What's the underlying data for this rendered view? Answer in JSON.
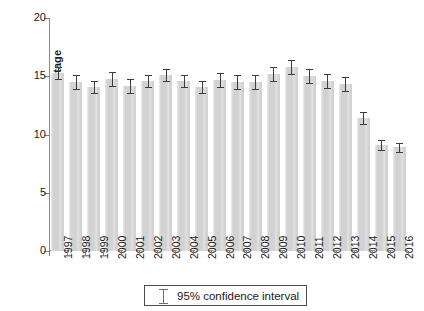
{
  "chart_data": {
    "type": "bar",
    "title": "",
    "subtitle": "",
    "xlabel": "",
    "ylabel": "Percentage",
    "ylim": [
      0,
      20
    ],
    "yticks": [
      0,
      5,
      10,
      15,
      20
    ],
    "ytick_labels": [
      "0",
      "5",
      "10",
      "15",
      "20"
    ],
    "grid": false,
    "legend_position": "bottom-center",
    "legend": [
      {
        "label": "95% confidence interval",
        "marker": "error-bar-glyph"
      }
    ],
    "bar_color": "#d2d2d2",
    "error_bar_color": "#3c3c3c",
    "axis_color": "#8a8a8a",
    "categories": [
      "1997",
      "1998",
      "1999",
      "2000",
      "2001",
      "2002",
      "2003",
      "2004",
      "2005",
      "2006",
      "2007",
      "2008",
      "2009",
      "2010",
      "2011",
      "2012",
      "2013",
      "2014",
      "2015",
      "2016"
    ],
    "values": [
      15.3,
      14.5,
      14.1,
      14.8,
      14.2,
      14.6,
      15.1,
      14.6,
      14.1,
      14.7,
      14.5,
      14.5,
      15.2,
      15.8,
      15.0,
      14.6,
      14.3,
      11.4,
      9.1,
      8.9
    ],
    "ci_low": [
      14.8,
      13.9,
      13.6,
      14.2,
      13.6,
      14.1,
      14.6,
      14.1,
      13.6,
      14.1,
      13.9,
      13.9,
      14.6,
      15.2,
      14.4,
      14.0,
      13.7,
      10.9,
      8.7,
      8.5
    ],
    "ci_high": [
      15.8,
      15.1,
      14.6,
      15.4,
      14.8,
      15.1,
      15.6,
      15.1,
      14.6,
      15.3,
      15.1,
      15.1,
      15.8,
      16.4,
      15.6,
      15.2,
      14.9,
      11.9,
      9.5,
      9.3
    ],
    "series": [
      {
        "name": "Percentage",
        "values": [
          15.3,
          14.5,
          14.1,
          14.8,
          14.2,
          14.6,
          15.1,
          14.6,
          14.1,
          14.7,
          14.5,
          14.5,
          15.2,
          15.8,
          15.0,
          14.6,
          14.3,
          11.4,
          9.1,
          8.9
        ]
      }
    ]
  }
}
